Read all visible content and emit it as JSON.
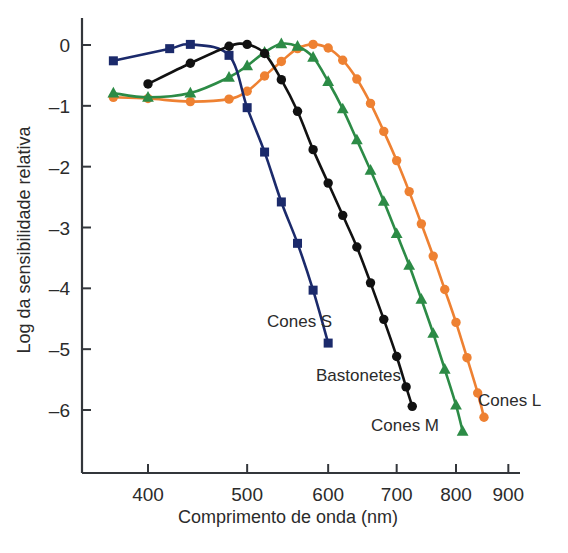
{
  "chart_data": {
    "type": "line",
    "title": "",
    "xlabel": "Comprimento de onda (nm)",
    "ylabel": "Log da sensibilidade relativa",
    "x_scale": "log",
    "xlim": [
      360,
      900
    ],
    "ylim": [
      -6.7,
      0.45
    ],
    "xticks": [
      400,
      500,
      600,
      700,
      800,
      900
    ],
    "xticklabels": [
      "400",
      "500",
      "600",
      "700",
      "800",
      "900"
    ],
    "yticks": [
      0,
      -1,
      -2,
      -3,
      -4,
      -5,
      -6
    ],
    "yticklabels": [
      "0",
      "–1",
      "–2",
      "–3",
      "–4",
      "–5",
      "–6"
    ],
    "grid": false,
    "legend_position": "inline-annotations",
    "series": [
      {
        "name": "Cones S",
        "label": "Cones S",
        "color": "#1b2a6b",
        "marker": "square",
        "points": [
          {
            "x": 370,
            "y": -0.26
          },
          {
            "x": 420,
            "y": -0.06
          },
          {
            "x": 440,
            "y": 0.01
          },
          {
            "x": 480,
            "y": -0.17
          },
          {
            "x": 500,
            "y": -1.03
          },
          {
            "x": 520,
            "y": -1.76
          },
          {
            "x": 540,
            "y": -2.58
          },
          {
            "x": 560,
            "y": -3.26
          },
          {
            "x": 580,
            "y": -4.03
          },
          {
            "x": 600,
            "y": -4.9
          }
        ]
      },
      {
        "name": "Bastonetes",
        "label": "Bastonetes",
        "color": "#111111",
        "marker": "circle",
        "points": [
          {
            "x": 400,
            "y": -0.64
          },
          {
            "x": 440,
            "y": -0.3
          },
          {
            "x": 480,
            "y": -0.02
          },
          {
            "x": 500,
            "y": 0.01
          },
          {
            "x": 520,
            "y": -0.14
          },
          {
            "x": 540,
            "y": -0.57
          },
          {
            "x": 560,
            "y": -1.09
          },
          {
            "x": 580,
            "y": -1.72
          },
          {
            "x": 600,
            "y": -2.27
          },
          {
            "x": 620,
            "y": -2.8
          },
          {
            "x": 640,
            "y": -3.32
          },
          {
            "x": 660,
            "y": -3.91
          },
          {
            "x": 680,
            "y": -4.51
          },
          {
            "x": 700,
            "y": -5.12
          },
          {
            "x": 715,
            "y": -5.62
          },
          {
            "x": 725,
            "y": -5.94
          }
        ]
      },
      {
        "name": "Cones M",
        "label": "Cones M",
        "color": "#2c8b46",
        "marker": "triangle",
        "points": [
          {
            "x": 370,
            "y": -0.79
          },
          {
            "x": 400,
            "y": -0.86
          },
          {
            "x": 440,
            "y": -0.79
          },
          {
            "x": 480,
            "y": -0.53
          },
          {
            "x": 500,
            "y": -0.34
          },
          {
            "x": 520,
            "y": -0.12
          },
          {
            "x": 540,
            "y": 0.02
          },
          {
            "x": 560,
            "y": -0.02
          },
          {
            "x": 580,
            "y": -0.2
          },
          {
            "x": 600,
            "y": -0.6
          },
          {
            "x": 620,
            "y": -1.05
          },
          {
            "x": 640,
            "y": -1.56
          },
          {
            "x": 660,
            "y": -2.06
          },
          {
            "x": 680,
            "y": -2.57
          },
          {
            "x": 700,
            "y": -3.1
          },
          {
            "x": 720,
            "y": -3.62
          },
          {
            "x": 740,
            "y": -4.18
          },
          {
            "x": 760,
            "y": -4.74
          },
          {
            "x": 780,
            "y": -5.33
          },
          {
            "x": 800,
            "y": -5.92
          },
          {
            "x": 812,
            "y": -6.35
          }
        ]
      },
      {
        "name": "Cones L",
        "label": "Cones L",
        "color": "#ee8132",
        "marker": "circle",
        "points": [
          {
            "x": 370,
            "y": -0.86
          },
          {
            "x": 400,
            "y": -0.88
          },
          {
            "x": 440,
            "y": -0.93
          },
          {
            "x": 480,
            "y": -0.89
          },
          {
            "x": 500,
            "y": -0.76
          },
          {
            "x": 520,
            "y": -0.51
          },
          {
            "x": 540,
            "y": -0.27
          },
          {
            "x": 560,
            "y": -0.06
          },
          {
            "x": 580,
            "y": 0.01
          },
          {
            "x": 600,
            "y": -0.05
          },
          {
            "x": 620,
            "y": -0.25
          },
          {
            "x": 640,
            "y": -0.56
          },
          {
            "x": 660,
            "y": -0.96
          },
          {
            "x": 680,
            "y": -1.42
          },
          {
            "x": 700,
            "y": -1.9
          },
          {
            "x": 720,
            "y": -2.41
          },
          {
            "x": 740,
            "y": -2.94
          },
          {
            "x": 760,
            "y": -3.47
          },
          {
            "x": 780,
            "y": -4.02
          },
          {
            "x": 800,
            "y": -4.56
          },
          {
            "x": 820,
            "y": -5.14
          },
          {
            "x": 840,
            "y": -5.72
          },
          {
            "x": 852,
            "y": -6.12
          }
        ]
      }
    ],
    "annotations": [
      {
        "text": "Cones S",
        "x_px": 267,
        "y_px": 327,
        "anchor": "start"
      },
      {
        "text": "Bastonetes",
        "x_px": 316,
        "y_px": 381,
        "anchor": "start"
      },
      {
        "text": "Cones L",
        "x_px": 478,
        "y_px": 406,
        "anchor": "start"
      },
      {
        "text": "Cones M",
        "x_px": 371,
        "y_px": 431,
        "anchor": "start"
      }
    ]
  }
}
